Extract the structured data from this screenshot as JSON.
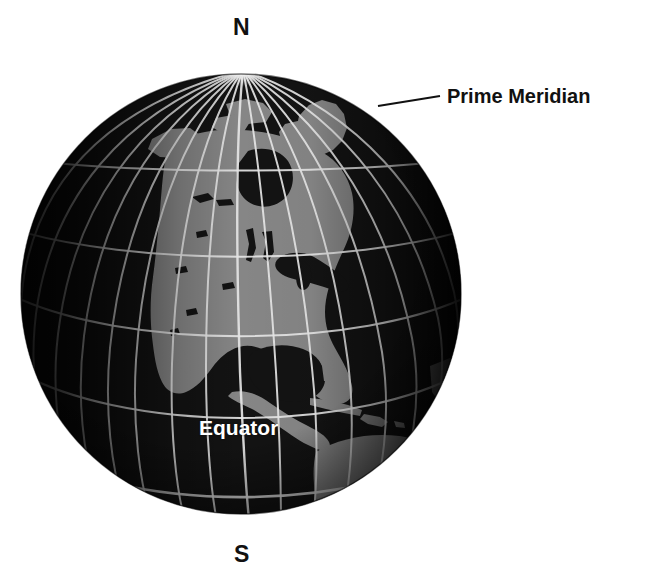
{
  "figure": {
    "background_color": "#ffffff",
    "width": 649,
    "height": 580
  },
  "globe": {
    "center_x": 241,
    "center_y": 294,
    "radius": 220,
    "land_color": "#8d8d8d",
    "ocean_color": "#141414",
    "shadow_color": "#050505",
    "graticule_color": "#f2f2f2",
    "graticule_spacing_degrees": 15,
    "projection": "orthographic",
    "center_longitude": -95,
    "center_latitude": 33,
    "region_shown": "North America and northern South America"
  },
  "labels": {
    "north_pole": "N",
    "south_pole": "S",
    "prime_meridian": "Prime Meridian",
    "equator": "Equator"
  },
  "leader_line": {
    "from_x": 378,
    "from_y": 106,
    "to_x": 440,
    "to_y": 96,
    "color": "#111111",
    "width": 2
  },
  "landmasses": [
    "North America",
    "Greenland",
    "Central America",
    "Caribbean Islands",
    "northern South America",
    "Great Lakes"
  ],
  "colors": {
    "text_dark": "#111111",
    "text_light": "#ffffff",
    "accent": "#f2f2f2"
  }
}
